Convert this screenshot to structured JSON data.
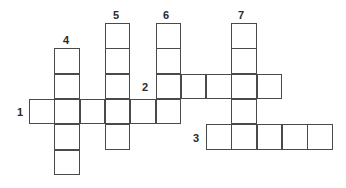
{
  "puzzle": {
    "cell_size": 25.3,
    "origin_x": 29,
    "origin_y": 23,
    "numbers": [
      {
        "label": "1",
        "x": 17,
        "y": 107
      },
      {
        "label": "2",
        "x": 142,
        "y": 82
      },
      {
        "label": "3",
        "x": 193,
        "y": 133
      },
      {
        "label": "4",
        "x": 63,
        "y": 35
      },
      {
        "label": "5",
        "x": 113,
        "y": 10
      },
      {
        "label": "6",
        "x": 163,
        "y": 10
      },
      {
        "label": "7",
        "x": 238,
        "y": 10
      }
    ],
    "words": [
      {
        "number": "1",
        "direction": "across",
        "col": 0,
        "row": 3,
        "length": 6
      },
      {
        "number": "2",
        "direction": "across",
        "col": 5,
        "row": 2,
        "length": 5
      },
      {
        "number": "3",
        "direction": "across",
        "col": 7,
        "row": 4,
        "length": 5
      },
      {
        "number": "4",
        "direction": "down",
        "col": 1,
        "row": 1,
        "length": 5
      },
      {
        "number": "5",
        "direction": "down",
        "col": 3,
        "row": 0,
        "length": 5
      },
      {
        "number": "6",
        "direction": "down",
        "col": 5,
        "row": 0,
        "length": 4
      },
      {
        "number": "7",
        "direction": "down",
        "col": 8,
        "row": 0,
        "length": 5
      }
    ]
  }
}
